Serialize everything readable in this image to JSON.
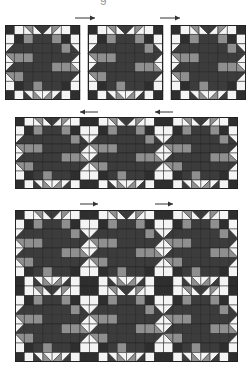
{
  "caption_remnant": "g",
  "colors": {
    "dark": "#2e2e2e",
    "star": "#3c3c3c",
    "gray": "#8f8f8f",
    "white": "#f4f4f4",
    "line": "#222222",
    "arrow": "#333333"
  },
  "block_pattern": {
    "size": 8,
    "legend": "D=dark square, W=white square, S=star-dark square, G=gray square; triangles: 'a/b:dir' = half-square split, first color top-left side",
    "rows": [
      [
        "D",
        "W",
        "W/G:\\",
        "W/S:\\",
        "S/W:/",
        "G/W:/",
        "W",
        "D"
      ],
      [
        "W",
        "D",
        "G",
        "S",
        "S",
        "G",
        "D",
        "W"
      ],
      [
        "W/S:/",
        "S",
        "S",
        "S",
        "S",
        "S",
        "G",
        "S/W:\\"
      ],
      [
        "W/G:\\",
        "G",
        "G",
        "S",
        "S",
        "S",
        "S",
        "S/W:/"
      ],
      [
        "W/S:/",
        "S",
        "S",
        "S",
        "S",
        "G",
        "G",
        "G/W:\\"
      ],
      [
        "W/G:\\",
        "G",
        "S",
        "S",
        "S",
        "S",
        "S",
        "S/W:/"
      ],
      [
        "W",
        "D",
        "S",
        "G",
        "S",
        "S",
        "D",
        "W"
      ],
      [
        "D",
        "W",
        "S/W:\\",
        "G/W:\\",
        "W/G:/",
        "W/S:/",
        "W",
        "D"
      ]
    ]
  },
  "sections": [
    {
      "name": "row-separate-blocks",
      "layout": "separate",
      "blocks": 3,
      "rows": 1,
      "x": 5,
      "y": 25,
      "block_px": 75,
      "gap": 8
    },
    {
      "name": "row-joined-strip",
      "layout": "joined",
      "blocks": 3,
      "rows": 1,
      "x": 15,
      "y": 117,
      "w": 223,
      "h": 72
    },
    {
      "name": "quilt-two-rows",
      "layout": "joined",
      "blocks": 3,
      "rows": 2,
      "x": 15,
      "y": 210,
      "w": 223,
      "h": 152
    }
  ],
  "arrows": [
    {
      "dir": "right",
      "x": 75,
      "y": 15,
      "w": 20
    },
    {
      "dir": "right",
      "x": 160,
      "y": 15,
      "w": 20
    },
    {
      "dir": "left",
      "x": 80,
      "y": 109,
      "w": 18
    },
    {
      "dir": "left",
      "x": 155,
      "y": 109,
      "w": 18
    },
    {
      "dir": "right",
      "x": 80,
      "y": 201,
      "w": 18
    },
    {
      "dir": "right",
      "x": 155,
      "y": 201,
      "w": 18
    }
  ]
}
